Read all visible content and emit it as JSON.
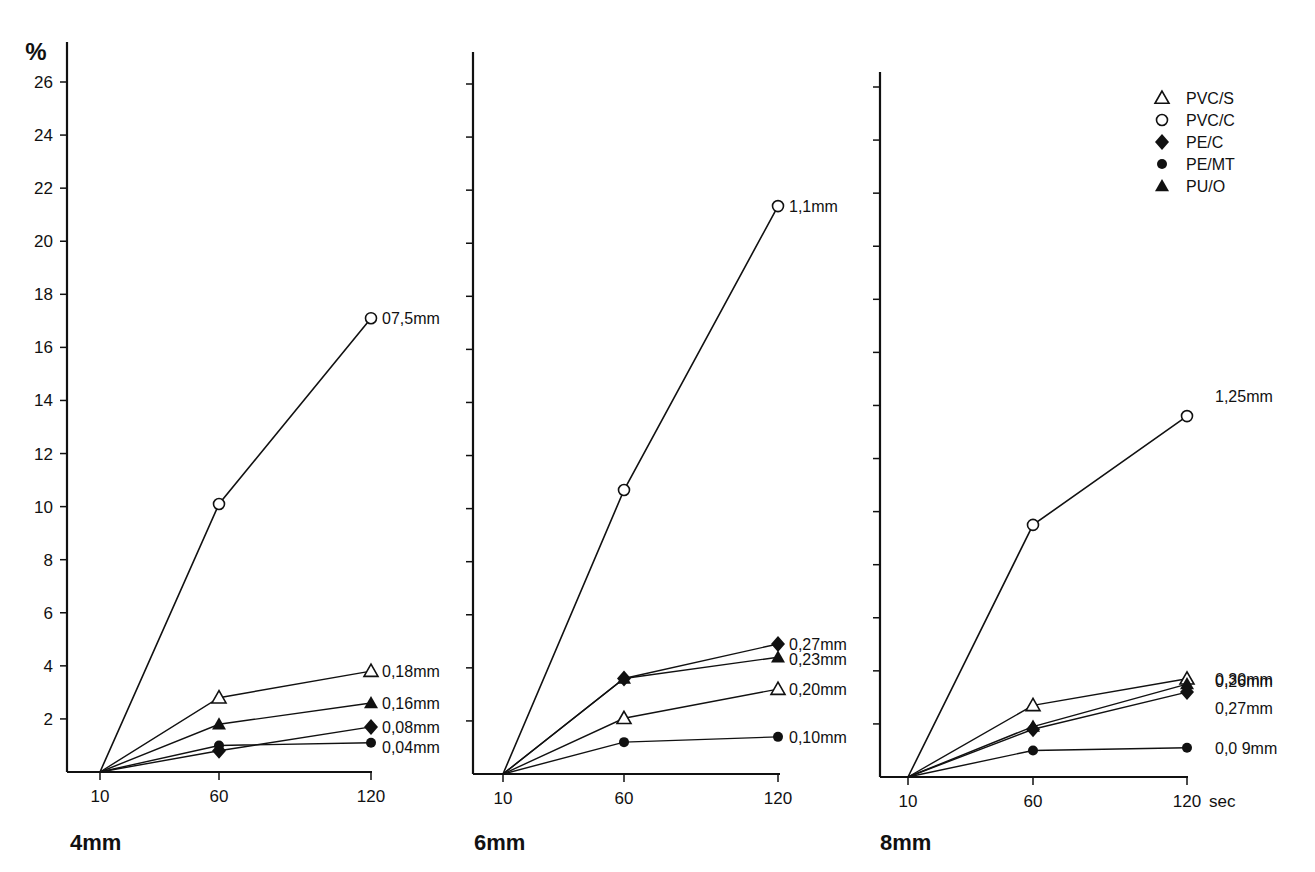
{
  "chart_data": {
    "type": "line",
    "y_unit_label": "%",
    "x_unit_label": "sec",
    "x": [
      10,
      60,
      120
    ],
    "x_tick_labels": [
      "10",
      "60",
      "120"
    ],
    "y_ticks": [
      2,
      4,
      6,
      8,
      10,
      12,
      14,
      16,
      18,
      20,
      22,
      24,
      26
    ],
    "ylim": [
      0,
      27
    ],
    "legend": [
      {
        "key": "PVC/S",
        "marker": "open-triangle"
      },
      {
        "key": "PVC/C",
        "marker": "open-circle"
      },
      {
        "key": "PE/C",
        "marker": "filled-diamond"
      },
      {
        "key": "PE/MT",
        "marker": "filled-circle"
      },
      {
        "key": "PU/O",
        "marker": "filled-triangle"
      }
    ],
    "legend_position": "top-right",
    "grid": false,
    "panels": [
      {
        "title": "4mm",
        "series": [
          {
            "name": "PVC/C",
            "values": [
              0,
              10.1,
              17.1
            ],
            "end_label": "07,5mm"
          },
          {
            "name": "PVC/S",
            "values": [
              0,
              2.8,
              3.8
            ],
            "end_label": "0,18mm"
          },
          {
            "name": "PU/O",
            "values": [
              0,
              1.8,
              2.6
            ],
            "end_label": "0,16mm"
          },
          {
            "name": "PE/C",
            "values": [
              0,
              0.8,
              1.7
            ],
            "end_label": "0,08mm"
          },
          {
            "name": "PE/MT",
            "values": [
              0,
              1.0,
              1.1
            ],
            "end_label": "0,04mm"
          }
        ]
      },
      {
        "title": "6mm",
        "series": [
          {
            "name": "PVC/C",
            "values": [
              0,
              10.7,
              21.4
            ],
            "end_label": "1,1mm"
          },
          {
            "name": "PE/C",
            "values": [
              0,
              3.6,
              4.9
            ],
            "end_label": "0,27mm"
          },
          {
            "name": "PU/O",
            "values": [
              0,
              3.6,
              4.4
            ],
            "end_label": "0,23mm"
          },
          {
            "name": "PVC/S",
            "values": [
              0,
              2.1,
              3.2
            ],
            "end_label": "0,20mm"
          },
          {
            "name": "PE/MT",
            "values": [
              0,
              1.2,
              1.4
            ],
            "end_label": "0,10mm"
          }
        ]
      },
      {
        "title": "8mm",
        "series": [
          {
            "name": "PVC/C",
            "values": [
              0,
              9.5,
              13.6
            ],
            "end_label": "1,25mm"
          },
          {
            "name": "PVC/S",
            "values": [
              0,
              2.7,
              3.7
            ],
            "end_label": "0,30mm"
          },
          {
            "name": "PU/O",
            "values": [
              0,
              1.9,
              3.5
            ],
            "end_label": "0,26mm"
          },
          {
            "name": "PE/C",
            "values": [
              0,
              1.8,
              3.2
            ],
            "end_label": "0,27mm"
          },
          {
            "name": "PE/MT",
            "values": [
              0,
              1.0,
              1.1
            ],
            "end_label": "0,0 9mm"
          }
        ]
      }
    ]
  }
}
